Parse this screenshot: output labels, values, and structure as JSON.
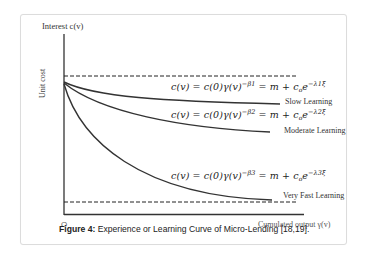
{
  "figure": {
    "y_axis_title": "Interest c(v)",
    "y_axis_label": "Unit cost",
    "x_axis_label": "Cumulated output γ(v)",
    "origin_label": "O",
    "caption_prefix": "Figure 4:",
    "caption_text": " Experience or Learning Curve of Micro-Lending [18,19].",
    "curves": [
      {
        "name": "slow",
        "label": "Slow Learning",
        "eq_left": "c(v) = c(0)γ(v)",
        "eq_exp": "−β1",
        "eq_mid": " =  m + c",
        "eq_sub": "o",
        "eq_e": "e",
        "eq_e_exp": "−λ1ξ"
      },
      {
        "name": "moderate",
        "label": "Moderate Learning",
        "eq_left": "c(v) = c(0)γ(v)",
        "eq_exp": "−β2",
        "eq_mid": " =  m + c",
        "eq_sub": "o",
        "eq_e": "e",
        "eq_e_exp": "−λ2ξ"
      },
      {
        "name": "very-fast",
        "label": "Very Fast Learning",
        "eq_left": "c(v) = c(0)γ(v)",
        "eq_exp": "−β3",
        "eq_mid": " =  m + c",
        "eq_sub": "o",
        "eq_e": "e",
        "eq_e_exp": "−λ3ξ"
      }
    ],
    "reference_lines": [
      "upper dashed asymptote (initial cost c(0))",
      "lower dashed asymptote (minimum cost m)"
    ]
  }
}
